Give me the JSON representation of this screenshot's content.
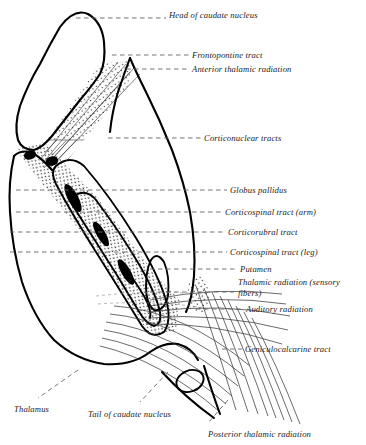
{
  "figure": {
    "background_color": "#ffffff",
    "ink_color": "#000000",
    "leader_color": "#555555",
    "fiber_color": "#444444",
    "stipple_color": "#000000"
  },
  "labels": [
    {
      "id": "head-of-caudate-nucleus",
      "text": "Head  of caudate nucleus",
      "x": 169,
      "y": 10,
      "wrap": false
    },
    {
      "id": "frontopontine-tract",
      "text": "Frontopontine tract",
      "x": 192,
      "y": 50,
      "wrap": false
    },
    {
      "id": "anterior-thalamic-radiation",
      "text": "Anterior thalamic radiation",
      "x": 192,
      "y": 64,
      "wrap": false
    },
    {
      "id": "corticonuclear-tracts",
      "text": "Corticonuclear tracts",
      "x": 204,
      "y": 133,
      "wrap": false
    },
    {
      "id": "globus-pallidus",
      "text": "Globus pallidus",
      "x": 230,
      "y": 185,
      "wrap": false
    },
    {
      "id": "corticospinal-tract-arm",
      "text": "Corticospinal tract (arm)",
      "x": 225,
      "y": 207,
      "wrap": false
    },
    {
      "id": "corticorubral-tract",
      "text": "Corticorubral tract",
      "x": 228,
      "y": 227,
      "wrap": false
    },
    {
      "id": "corticospinal-tract-leg",
      "text": "Corticospinal tract (leg)",
      "x": 230,
      "y": 247,
      "wrap": false
    },
    {
      "id": "putamen",
      "text": "Putamen",
      "x": 240,
      "y": 264,
      "wrap": false
    },
    {
      "id": "thalamic-radiation-sensory",
      "text": "Thalamic radiation (sensory fibers)",
      "x": 238,
      "y": 277,
      "wrap": true
    },
    {
      "id": "auditory-radiation",
      "text": "Auditory radiation",
      "x": 246,
      "y": 304,
      "wrap": false
    },
    {
      "id": "geniculocalcarine-tract",
      "text": "Geniculocalcarine tract",
      "x": 245,
      "y": 344,
      "wrap": false
    },
    {
      "id": "thalamus",
      "text": "Thalamus",
      "x": 14,
      "y": 404,
      "wrap": false
    },
    {
      "id": "tail-of-caudate-nucleus",
      "text": "Tail of caudate nucleus",
      "x": 88,
      "y": 409,
      "wrap": false
    },
    {
      "id": "posterior-thalamic-radiation",
      "text": "Posterior thalamic radiation",
      "x": 208,
      "y": 429,
      "wrap": false
    }
  ]
}
